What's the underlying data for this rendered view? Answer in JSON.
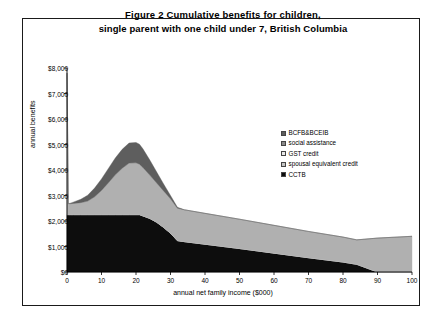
{
  "title": {
    "line1": "Figure 2   Cumulative benefits for children,",
    "line2": "single parent with one child under 7, British Columbia"
  },
  "axes": {
    "ylabel": "annual benefits",
    "xlabel": "annual net family income ($000)",
    "yticks": [
      "$0",
      "$1,000",
      "$2,000",
      "$3,000",
      "$4,000",
      "$5,000",
      "$6,000",
      "$7,000",
      "$8,000"
    ],
    "xticks": [
      "0",
      "10",
      "20",
      "30",
      "40",
      "50",
      "60",
      "70",
      "80",
      "90",
      "100"
    ]
  },
  "legend": [
    {
      "label": "BCFB&BCEIB",
      "color": "#5e5e5e"
    },
    {
      "label": "social assistance",
      "color": "#8a8a8a"
    },
    {
      "label": "GST credit",
      "color": "#e8e8e8"
    },
    {
      "label": "spousal equivalent credit",
      "color": "#c4c4c4"
    },
    {
      "label": "CCTB",
      "color": "#0d0d0d"
    }
  ],
  "chart_data": {
    "type": "area",
    "title": "Figure 2   Cumulative benefits for children, single parent with one child under 7, British Columbia",
    "xlabel": "annual net family income ($000)",
    "ylabel": "annual benefits",
    "xlim": [
      0,
      100
    ],
    "ylim": [
      0,
      8000
    ],
    "grid": false,
    "legend_position": "inside-right",
    "stacked": true,
    "x": [
      0,
      0.4,
      1,
      2,
      4,
      6,
      8,
      10,
      12,
      14,
      16,
      18,
      20,
      21,
      22,
      24,
      26,
      28,
      30,
      32,
      34,
      40,
      50,
      60,
      70,
      80,
      84,
      90,
      100
    ],
    "series": [
      {
        "name": "CCTB",
        "color": "#0d0d0d",
        "values": [
          2250,
          2250,
          2250,
          2250,
          2250,
          2250,
          2250,
          2250,
          2250,
          2250,
          2250,
          2250,
          2250,
          2250,
          2200,
          2100,
          1950,
          1750,
          1520,
          1230,
          1190,
          1090,
          920,
          740,
          560,
          390,
          300,
          0,
          0
        ]
      },
      {
        "name": "spousal equivalent credit",
        "color": "#c4c4c4",
        "values": [
          0,
          0,
          0,
          0,
          0,
          0,
          0,
          0,
          0,
          0,
          0,
          0,
          0,
          0,
          0,
          0,
          0,
          0,
          0,
          0,
          0,
          0,
          0,
          0,
          0,
          0,
          0,
          0,
          0
        ]
      },
      {
        "name": "GST credit",
        "color": "#e8e8e8",
        "values": [
          0,
          0,
          0,
          0,
          0,
          0,
          0,
          0,
          0,
          0,
          0,
          0,
          0,
          0,
          0,
          0,
          0,
          0,
          0,
          0,
          0,
          0,
          0,
          0,
          0,
          0,
          0,
          0,
          0
        ]
      },
      {
        "name": "social assistance",
        "color": "#b0b0b0",
        "values": [
          5550,
          430,
          430,
          440,
          470,
          530,
          700,
          950,
          1250,
          1560,
          1820,
          2020,
          2030,
          1980,
          1900,
          1700,
          1540,
          1430,
          1350,
          1270,
          1250,
          1210,
          1150,
          1090,
          1030,
          980,
          960,
          1330,
          1400
        ]
      },
      {
        "name": "BCFB&BCEIB",
        "color": "#5e5e5e",
        "values": [
          0,
          0,
          20,
          60,
          130,
          230,
          340,
          450,
          560,
          660,
          740,
          790,
          800,
          780,
          730,
          590,
          430,
          270,
          130,
          40,
          0,
          0,
          0,
          0,
          0,
          0,
          0,
          0,
          0
        ]
      }
    ]
  }
}
